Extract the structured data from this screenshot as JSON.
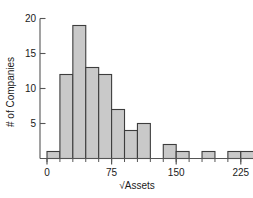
{
  "chart_data": {
    "type": "bar",
    "title": "",
    "subtitle": "",
    "xlabel": "√Assets",
    "ylabel": "# of Companies",
    "orientation": "vertical",
    "histogram": true,
    "bin_width": 15,
    "bin_starts": [
      0,
      15,
      30,
      45,
      60,
      75,
      90,
      105,
      120,
      135,
      150,
      165,
      180,
      195,
      210,
      225
    ],
    "bin_labels": [
      "0–15",
      "15–30",
      "30–45",
      "45–60",
      "60–75",
      "75–90",
      "90–105",
      "105–120",
      "120–135",
      "135–150",
      "150–165",
      "165–180",
      "180–195",
      "195–210",
      "210–225",
      "225–240"
    ],
    "categories": [
      "0–15",
      "15–30",
      "30–45",
      "45–60",
      "60–75",
      "75–90",
      "90–105",
      "105–120",
      "120–135",
      "135–150",
      "150–165",
      "165–180",
      "180–195",
      "195–210",
      "210–225",
      "225–240"
    ],
    "values": [
      1,
      12,
      19,
      13,
      12,
      7,
      4,
      5,
      0,
      2,
      1,
      0,
      1,
      0,
      1,
      1
    ],
    "xlim": [
      -8,
      248
    ],
    "ylim": [
      0,
      20
    ],
    "xticks": [
      0,
      75,
      150,
      225
    ],
    "xtick_labels": [
      "0",
      "75",
      "150",
      "225"
    ],
    "xminor_step": 15,
    "yticks": [
      5,
      10,
      15,
      20
    ],
    "ytick_labels": [
      "5",
      "10",
      "15",
      "20"
    ],
    "grid": false,
    "legend": false,
    "legend_position": "none",
    "bar_fill": "#c9c9c9",
    "bar_edge": "#3d3d3d",
    "axis_color": "#555555",
    "text_color": "#1a1a1a",
    "background": "#ffffff"
  },
  "axes": {
    "y_label_text": "# of Companies",
    "x_label_text": "√Assets"
  }
}
